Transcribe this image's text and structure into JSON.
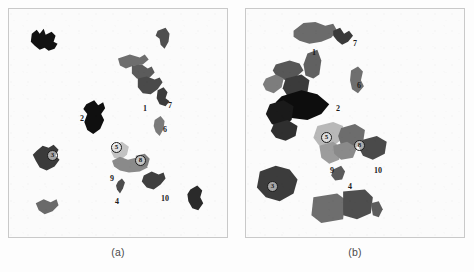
{
  "figure": {
    "panels": [
      {
        "id": "a",
        "caption": "(a)",
        "labels": [
          {
            "text": "1",
            "x": 134,
            "y": 96,
            "circled": false
          },
          {
            "text": "7",
            "x": 159,
            "y": 93,
            "circled": false
          },
          {
            "text": "2",
            "x": 71,
            "y": 106,
            "circled": false
          },
          {
            "text": "6",
            "x": 154,
            "y": 117,
            "circled": false
          },
          {
            "text": "3",
            "x": 38,
            "y": 141,
            "circled": true
          },
          {
            "text": "5",
            "x": 102,
            "y": 133,
            "circled": true
          },
          {
            "text": "8",
            "x": 126,
            "y": 146,
            "circled": true
          },
          {
            "text": "9",
            "x": 101,
            "y": 166,
            "circled": false
          },
          {
            "text": "4",
            "x": 106,
            "y": 189,
            "circled": false
          },
          {
            "text": "10",
            "x": 152,
            "y": 186,
            "circled": false
          }
        ],
        "shapes": [
          {
            "name": "patch-topleft",
            "fill": "#121212",
            "points": "23,25 28,21 31,25 35,20 37,26 43,23 47,27 45,33 49,35 46,40 40,42 36,39 31,41 26,37 22,33"
          },
          {
            "name": "patch-north",
            "fill": "#4f4f4f",
            "points": "150,22 158,19 162,25 161,33 157,40 153,36 152,30 148,27"
          },
          {
            "name": "patch-1-upper",
            "fill": "#6e6e6e",
            "points": "110,50 122,46 132,49 137,46 141,51 135,56 126,57 118,60 112,57"
          },
          {
            "name": "patch-1-mid",
            "fill": "#5b5b5b",
            "points": "124,57 134,56 140,60 144,58 147,64 142,69 136,72 129,70 124,65"
          },
          {
            "name": "patch-1-lower",
            "fill": "#4a4a4a",
            "points": "130,70 139,68 147,71 152,69 155,74 150,81 143,86 135,85 130,79"
          },
          {
            "name": "patch-7",
            "fill": "#3c3c3c",
            "points": "150,82 156,79 160,84 158,90 162,93 158,98 152,96 149,90"
          },
          {
            "name": "patch-2",
            "fill": "#0f0f0f",
            "points": "78,96 86,92 90,97 95,94 97,100 93,106 96,112 92,121 85,126 79,122 76,114 79,106 75,101"
          },
          {
            "name": "patch-6",
            "fill": "#7a7a7a",
            "points": "147,112 153,108 157,113 156,121 152,128 148,124 146,118"
          },
          {
            "name": "patch-3",
            "fill": "#3a3a3a",
            "points": "28,143 34,138 40,140 45,137 50,142 47,148 51,152 46,159 38,163 31,160 27,153 24,147"
          },
          {
            "name": "patch-5",
            "fill": "#c2c2c2",
            "points": "105,138 114,134 121,139 119,147 113,152 106,150 103,144"
          },
          {
            "name": "patch-9",
            "fill": "#8a8a8a",
            "points": "104,153 112,149 120,152 128,150 137,153 140,160 132,164 121,165 112,163 106,159"
          },
          {
            "name": "patch-8",
            "fill": "#7e7e7e",
            "points": "128,148 137,146 142,151 140,158 133,160 128,156"
          },
          {
            "name": "patch-4",
            "fill": "#4c4c4c",
            "points": "110,174 114,171 117,175 115,181 112,186 109,182 108,178"
          },
          {
            "name": "patch-10",
            "fill": "#3f3f3f",
            "points": "136,168 144,164 151,167 156,165 158,171 153,177 146,182 139,180 134,174"
          },
          {
            "name": "patch-bottomleft",
            "fill": "#6a6a6a",
            "points": "27,196 35,192 42,195 48,192 50,198 44,204 36,207 30,203"
          },
          {
            "name": "patch-bottomright",
            "fill": "#2a2a2a",
            "points": "183,182 190,178 195,183 193,190 196,196 191,203 185,201 181,194 180,187"
          }
        ]
      },
      {
        "id": "b",
        "caption": "(b)",
        "labels": [
          {
            "text": "1",
            "x": 66,
            "y": 40,
            "circled": false
          },
          {
            "text": "7",
            "x": 107,
            "y": 31,
            "circled": false
          },
          {
            "text": "6",
            "x": 111,
            "y": 73,
            "circled": false
          },
          {
            "text": "2",
            "x": 90,
            "y": 96,
            "circled": false
          },
          {
            "text": "5",
            "x": 75,
            "y": 123,
            "circled": true
          },
          {
            "text": "8",
            "x": 108,
            "y": 131,
            "circled": true
          },
          {
            "text": "9",
            "x": 84,
            "y": 158,
            "circled": false
          },
          {
            "text": "10",
            "x": 128,
            "y": 158,
            "circled": false
          },
          {
            "text": "3",
            "x": 21,
            "y": 172,
            "circled": true
          },
          {
            "text": "4",
            "x": 102,
            "y": 174,
            "circled": false
          }
        ],
        "shapes": [
          {
            "name": "patch-1",
            "fill": "#6b6b6b",
            "points": "48,22 58,14 70,13 80,17 88,15 92,22 86,29 76,33 64,35 54,32 48,28"
          },
          {
            "name": "patch-7",
            "fill": "#3a3a3a",
            "points": "88,22 95,19 99,25 104,22 108,27 103,33 97,36 92,32 88,27"
          },
          {
            "name": "patch-wedge",
            "fill": "#616161",
            "points": "62,45 72,41 76,52 74,66 68,70 60,67 58,56"
          },
          {
            "name": "patch-6",
            "fill": "#6f6f6f",
            "points": "106,62 113,58 118,63 116,72 119,78 113,85 107,81 105,72"
          },
          {
            "name": "patch-2-upper",
            "fill": "#575757",
            "points": "30,56 44,52 54,55 58,62 50,69 40,72 31,68 27,62"
          },
          {
            "name": "patch-2-midleft",
            "fill": "#7d7d7d",
            "points": "20,70 30,66 38,70 36,79 28,85 20,82 17,76"
          },
          {
            "name": "patch-2-block",
            "fill": "#3b3b3b",
            "points": "40,70 56,66 64,72 62,84 52,90 42,88 37,80"
          },
          {
            "name": "patch-2-main",
            "fill": "#0d0d0d",
            "points": "36,88 56,82 72,86 84,96 76,106 62,112 46,110 34,102 30,94"
          },
          {
            "name": "patch-2-lower",
            "fill": "#1a1a1a",
            "points": "24,96 38,92 48,98 46,112 36,120 26,116 20,106"
          },
          {
            "name": "patch-2-foot",
            "fill": "#2f2f2f",
            "points": "28,116 42,112 52,118 50,128 40,133 30,130 25,123"
          },
          {
            "name": "patch-5",
            "fill": "#b8b8b8",
            "points": "72,118 88,114 98,118 96,132 86,140 74,138 68,130"
          },
          {
            "name": "patch-9",
            "fill": "#9c9c9c",
            "points": "74,138 88,134 96,140 94,152 84,156 76,150"
          },
          {
            "name": "patch-8",
            "fill": "#6d6d6d",
            "points": "96,120 110,116 120,122 118,136 106,142 96,138 93,128"
          },
          {
            "name": "patch-8b",
            "fill": "#8a8a8a",
            "points": "88,138 102,134 112,140 108,150 96,152 89,146"
          },
          {
            "name": "patch-10",
            "fill": "#4a4a4a",
            "points": "118,132 132,128 142,134 140,146 128,152 118,148 114,140"
          },
          {
            "name": "patch-4",
            "fill": "#5a5a5a",
            "points": "88,162 96,158 100,164 97,172 90,173 86,168"
          },
          {
            "name": "patch-3",
            "fill": "#3c3c3c",
            "points": "14,164 30,158 44,162 52,172 48,186 34,194 20,190 11,180"
          },
          {
            "name": "patch-bottom-left",
            "fill": "#6e6e6e",
            "points": "68,190 92,186 100,192 98,212 76,216 66,208"
          },
          {
            "name": "patch-bottom-right",
            "fill": "#4e4e4e",
            "points": "98,184 120,182 128,190 126,206 112,212 98,208"
          },
          {
            "name": "patch-bottom-tail",
            "fill": "#5c5c5c",
            "points": "126,196 134,194 138,202 134,210 128,208"
          }
        ]
      }
    ]
  }
}
